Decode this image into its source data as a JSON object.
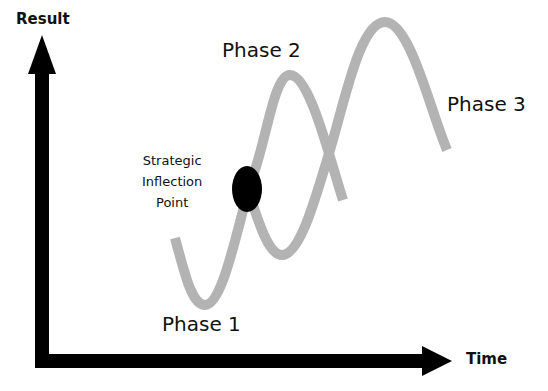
{
  "diagram": {
    "axes": {
      "y_label": "Result",
      "x_label": "Time"
    },
    "phases": [
      {
        "label": "Phase 1"
      },
      {
        "label": "Phase 2"
      },
      {
        "label": "Phase 3"
      }
    ],
    "annotation": {
      "line1": "Strategic",
      "line2": "Inflection",
      "line3": "Point"
    },
    "colors": {
      "axis": "#000000",
      "curve": "#b3b3b3",
      "marker": "#000000",
      "text": "#111111"
    }
  }
}
